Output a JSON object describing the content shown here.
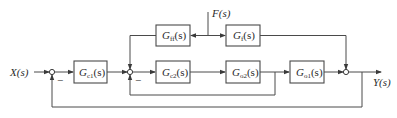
{
  "diagram": {
    "type": "block-diagram",
    "input": {
      "label": "X(s)"
    },
    "output": {
      "label": "Y(s)"
    },
    "disturbance": {
      "label": "F(s)"
    },
    "blocks": [
      {
        "id": "gc1",
        "G": "G",
        "sub": "c1",
        "arg": "(s)"
      },
      {
        "id": "gff",
        "G": "G",
        "sub": "ff",
        "arg": "(s)"
      },
      {
        "id": "gc2",
        "G": "G",
        "sub": "c2",
        "arg": "(s)"
      },
      {
        "id": "gf",
        "G": "G",
        "sub": "f",
        "arg": "(s)"
      },
      {
        "id": "ga2",
        "G": "G",
        "sub": "o2",
        "arg": "(s)"
      },
      {
        "id": "ga1",
        "G": "G",
        "sub": "o1",
        "arg": "(s)"
      }
    ],
    "summing_junctions": [
      {
        "id": "sum1",
        "minus_label": "−"
      },
      {
        "id": "sum2",
        "minus_label": "−"
      },
      {
        "id": "sum3"
      }
    ],
    "colors": {
      "line": "#4a4a4a",
      "text": "#2a2a2a",
      "background": "#ffffff"
    }
  }
}
